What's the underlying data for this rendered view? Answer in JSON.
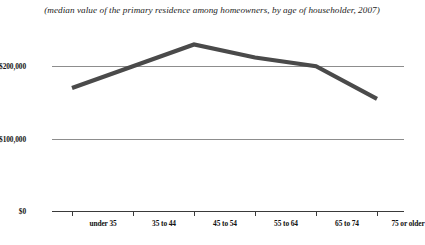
{
  "chart_data": {
    "type": "line",
    "title": "",
    "subtitle": "(median value of the primary residence among homeowners, by age of householder, 2007)",
    "xlabel": "",
    "ylabel": "",
    "categories": [
      "under 35",
      "35 to 44",
      "45 to 54",
      "55 to 64",
      "65 to 74",
      "75 or older"
    ],
    "values": [
      170000,
      200000,
      230000,
      212000,
      200000,
      155000
    ],
    "series": [
      {
        "name": "Median home value",
        "values": [
          170000,
          200000,
          230000,
          212000,
          200000,
          155000
        ]
      }
    ],
    "ylim": [
      0,
      250000
    ],
    "yticks": [
      0,
      100000,
      200000
    ],
    "ytick_labels": [
      "$0",
      "$100,000",
      "$200,000"
    ],
    "grid": true,
    "legend": "none",
    "line_color": "#4a4a4a",
    "grid_color": "#8d8d8d",
    "axis_color": "#3a3a3a"
  }
}
